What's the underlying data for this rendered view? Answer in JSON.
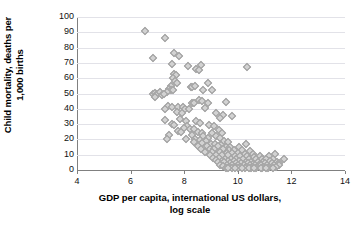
{
  "chart_data": {
    "type": "scatter",
    "title": "",
    "xlabel": "GDP per capita, international US dollars, log scale",
    "xlabel_line1": "GDP per capita, international US dollars,",
    "xlabel_line2": "log scale",
    "ylabel": "Child mortality, deaths per 1,000 births",
    "ylabel_line1": "Child mortality, deaths per",
    "ylabel_line2": "1,000 births",
    "xlim": [
      4,
      14
    ],
    "ylim": [
      0,
      100
    ],
    "xticks": [
      4,
      6,
      8,
      10,
      12,
      14
    ],
    "yticks": [
      0,
      10,
      20,
      30,
      40,
      50,
      60,
      70,
      80,
      90,
      100
    ],
    "grid": "horizontal",
    "legend": "none",
    "marker": "diamond",
    "marker_fill": "#d2d2d2",
    "marker_stroke": "#9a9a9a",
    "axis_color": "#808080",
    "gridline_color": "#e2e2e8",
    "background": "#ffffff",
    "points": [
      [
        6.55,
        91
      ],
      [
        7.28,
        86
      ],
      [
        6.85,
        73.5
      ],
      [
        7.62,
        76.5
      ],
      [
        7.82,
        74.5
      ],
      [
        7.55,
        69
      ],
      [
        8.15,
        68
      ],
      [
        8.62,
        68.5
      ],
      [
        8.45,
        66
      ],
      [
        8.55,
        65.5
      ],
      [
        10.33,
        67.5
      ],
      [
        7.62,
        63
      ],
      [
        7.7,
        62
      ],
      [
        7.58,
        60
      ],
      [
        7.65,
        58
      ],
      [
        7.72,
        57
      ],
      [
        8.88,
        57
      ],
      [
        7.5,
        55
      ],
      [
        8.25,
        54.5
      ],
      [
        8.3,
        54
      ],
      [
        8.42,
        55
      ],
      [
        7.45,
        53
      ],
      [
        7.52,
        52.5
      ],
      [
        7.6,
        52
      ],
      [
        7.35,
        51
      ],
      [
        8.7,
        52.5
      ],
      [
        9.05,
        52.5
      ],
      [
        6.85,
        50
      ],
      [
        6.92,
        50.5
      ],
      [
        7.0,
        50
      ],
      [
        7.1,
        51
      ],
      [
        7.18,
        49
      ],
      [
        7.25,
        50
      ],
      [
        6.9,
        48
      ],
      [
        8.55,
        46
      ],
      [
        8.65,
        45
      ],
      [
        8.3,
        44
      ],
      [
        8.38,
        43.5
      ],
      [
        9.55,
        44.5
      ],
      [
        8.9,
        43.5
      ],
      [
        7.38,
        42
      ],
      [
        7.55,
        41.5
      ],
      [
        7.78,
        41
      ],
      [
        7.95,
        41.5
      ],
      [
        7.3,
        40
      ],
      [
        8.02,
        40
      ],
      [
        8.18,
        40
      ],
      [
        8.78,
        40.5
      ],
      [
        7.72,
        38
      ],
      [
        7.9,
        37.5
      ],
      [
        9.18,
        37
      ],
      [
        9.45,
        36
      ],
      [
        9.8,
        35.5
      ],
      [
        9.35,
        34
      ],
      [
        7.3,
        33
      ],
      [
        7.85,
        33.5
      ],
      [
        8.05,
        32
      ],
      [
        8.45,
        32
      ],
      [
        8.6,
        31
      ],
      [
        7.55,
        30
      ],
      [
        7.62,
        29.5
      ],
      [
        8.12,
        29
      ],
      [
        8.92,
        29.5
      ],
      [
        9.12,
        29
      ],
      [
        7.98,
        27.5
      ],
      [
        8.22,
        27
      ],
      [
        8.35,
        26.5
      ],
      [
        9.28,
        26
      ],
      [
        7.75,
        25.5
      ],
      [
        7.88,
        25
      ],
      [
        8.5,
        25
      ],
      [
        8.65,
        24.5
      ],
      [
        9.05,
        24
      ],
      [
        9.42,
        24.5
      ],
      [
        7.45,
        23
      ],
      [
        8.28,
        23
      ],
      [
        8.72,
        22.5
      ],
      [
        9.2,
        22
      ],
      [
        8.88,
        21
      ],
      [
        9.32,
        21
      ],
      [
        7.35,
        20
      ],
      [
        8.08,
        20
      ],
      [
        8.42,
        20
      ],
      [
        8.58,
        19.5
      ],
      [
        8.8,
        19
      ],
      [
        9.48,
        19
      ],
      [
        9.62,
        18.5
      ],
      [
        10.3,
        17
      ],
      [
        8.35,
        18
      ],
      [
        8.68,
        17.5
      ],
      [
        9.0,
        17
      ],
      [
        9.15,
        17
      ],
      [
        9.38,
        16.5
      ],
      [
        8.52,
        16
      ],
      [
        8.85,
        16
      ],
      [
        9.25,
        15.5
      ],
      [
        9.55,
        15
      ],
      [
        9.72,
        15
      ],
      [
        10.05,
        15
      ],
      [
        8.62,
        14
      ],
      [
        8.95,
        14
      ],
      [
        9.1,
        13.5
      ],
      [
        9.45,
        13.5
      ],
      [
        9.68,
        13
      ],
      [
        9.85,
        13
      ],
      [
        10.15,
        13
      ],
      [
        10.45,
        12.5
      ],
      [
        8.78,
        12
      ],
      [
        9.02,
        12
      ],
      [
        9.32,
        11.5
      ],
      [
        9.58,
        11
      ],
      [
        9.78,
        11
      ],
      [
        10.0,
        11
      ],
      [
        10.25,
        10.5
      ],
      [
        10.55,
        10.5
      ],
      [
        11.4,
        10.5
      ],
      [
        8.95,
        10
      ],
      [
        9.2,
        10
      ],
      [
        9.42,
        9.5
      ],
      [
        9.65,
        9.5
      ],
      [
        9.88,
        9
      ],
      [
        10.1,
        9
      ],
      [
        10.35,
        9
      ],
      [
        10.6,
        8.5
      ],
      [
        10.82,
        9
      ],
      [
        11.15,
        9
      ],
      [
        11.72,
        7
      ],
      [
        9.08,
        8
      ],
      [
        9.3,
        8
      ],
      [
        9.52,
        7.5
      ],
      [
        9.75,
        7.5
      ],
      [
        9.95,
        7
      ],
      [
        10.2,
        7
      ],
      [
        10.42,
        7
      ],
      [
        10.68,
        7
      ],
      [
        10.9,
        7
      ],
      [
        11.05,
        7.5
      ],
      [
        11.3,
        7
      ],
      [
        9.18,
        6.5
      ],
      [
        9.4,
        6
      ],
      [
        9.62,
        6
      ],
      [
        9.85,
        6
      ],
      [
        10.05,
        6
      ],
      [
        10.3,
        5.5
      ],
      [
        10.5,
        5.5
      ],
      [
        10.75,
        5.5
      ],
      [
        10.95,
        5.5
      ],
      [
        11.2,
        6
      ],
      [
        11.45,
        5.5
      ],
      [
        9.25,
        5
      ],
      [
        9.48,
        5
      ],
      [
        9.7,
        4.5
      ],
      [
        9.92,
        4.5
      ],
      [
        10.12,
        4.5
      ],
      [
        10.38,
        4.5
      ],
      [
        10.58,
        4
      ],
      [
        10.82,
        4
      ],
      [
        11.0,
        4.5
      ],
      [
        11.28,
        4.5
      ],
      [
        11.52,
        4.5
      ],
      [
        9.35,
        3.5
      ],
      [
        9.58,
        3.5
      ],
      [
        9.8,
        3
      ],
      [
        10.0,
        3
      ],
      [
        10.22,
        3
      ],
      [
        10.45,
        3
      ],
      [
        10.65,
        3
      ],
      [
        10.88,
        3
      ],
      [
        11.1,
        3
      ],
      [
        11.35,
        3
      ],
      [
        11.55,
        3.5
      ],
      [
        9.45,
        2.5
      ],
      [
        9.68,
        2
      ],
      [
        9.9,
        2
      ],
      [
        10.1,
        2
      ],
      [
        10.32,
        2
      ],
      [
        10.52,
        2
      ],
      [
        10.72,
        2
      ],
      [
        10.95,
        2
      ],
      [
        11.18,
        2
      ],
      [
        11.42,
        2
      ],
      [
        9.55,
        1.5
      ],
      [
        9.78,
        1.5
      ],
      [
        10.02,
        1.5
      ],
      [
        10.25,
        1.5
      ],
      [
        10.48,
        1.5
      ],
      [
        10.68,
        1.5
      ],
      [
        10.9,
        1.5
      ],
      [
        11.12,
        1.5
      ],
      [
        9.88,
        1
      ],
      [
        10.15,
        1
      ],
      [
        10.4,
        1
      ],
      [
        10.62,
        1
      ],
      [
        10.85,
        1
      ],
      [
        11.05,
        1
      ],
      [
        11.3,
        1
      ],
      [
        9.65,
        1
      ]
    ]
  }
}
